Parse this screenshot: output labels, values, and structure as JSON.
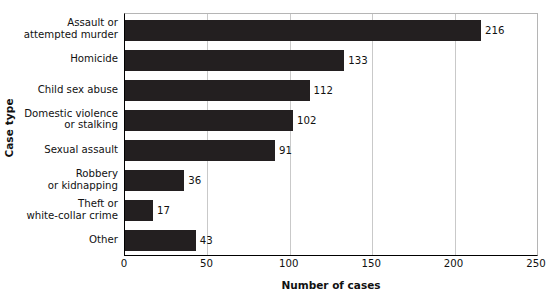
{
  "chart_data": {
    "type": "bar",
    "orientation": "horizontal",
    "title": "",
    "xlabel": "Number of cases",
    "ylabel": "Case type",
    "xlim": [
      0,
      250
    ],
    "xticks": [
      0,
      50,
      100,
      150,
      200,
      250
    ],
    "grid": "vertical",
    "legend": "none",
    "bar_color": "#231f20",
    "gridline_color": "#c9c9c9",
    "axis_color": "#000000",
    "categories": [
      "Assault or\nattempted murder",
      "Homicide",
      "Child sex abuse",
      "Domestic violence\nor stalking",
      "Sexual assault",
      "Robbery\nor kidnapping",
      "Theft or\nwhite-collar crime",
      "Other"
    ],
    "values": [
      216,
      133,
      112,
      102,
      91,
      36,
      17,
      43
    ],
    "value_labels": [
      "216",
      "133",
      "112",
      "102",
      "91",
      "36",
      "17",
      "43"
    ]
  }
}
